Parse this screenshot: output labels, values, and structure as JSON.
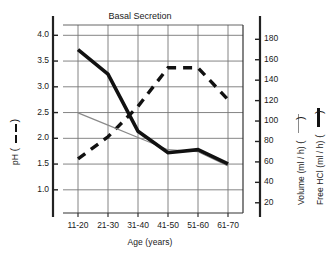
{
  "chart_data": {
    "type": "line",
    "title": "Basal Secretion",
    "xlabel": "Age (years)",
    "categories": [
      "11-20",
      "21-30",
      "31-40",
      "41-50",
      "51-60",
      "61-70"
    ],
    "left_axis": {
      "label": "pH",
      "ticks": [
        "1.0",
        "1.5",
        "2.0",
        "2.5",
        "3.0",
        "3.5",
        "4.0"
      ],
      "tick_values": [
        1.0,
        1.5,
        2.0,
        2.5,
        3.0,
        3.5,
        4.0
      ],
      "ylim": [
        0.55,
        4.2
      ]
    },
    "right_axis": {
      "labels": [
        "Volume (ml / h)",
        "Free HCl (ml / h)"
      ],
      "ticks": [
        "20",
        "40",
        "60",
        "80",
        "100",
        "120",
        "140",
        "160",
        "180"
      ],
      "tick_values": [
        20,
        40,
        60,
        80,
        100,
        120,
        140,
        160,
        180
      ],
      "ylim": [
        10,
        194
      ]
    },
    "grid": true,
    "legend_position": "axis-titles",
    "series": [
      {
        "name": "pH",
        "axis": "left",
        "style": "dashed",
        "color": "#111111",
        "width": 3.4,
        "values": [
          1.6,
          2.03,
          2.62,
          3.37,
          3.37,
          2.75
        ]
      },
      {
        "name": "Volume (ml / h)",
        "axis": "right",
        "style": "thin-solid",
        "color": "#8a8a8a",
        "width": 1.1,
        "values": [
          108,
          96,
          84,
          72,
          70,
          56
        ]
      },
      {
        "name": "Free HCl (ml / h)",
        "axis": "right",
        "style": "thick-solid",
        "color": "#111111",
        "width": 3.6,
        "values": [
          170,
          146,
          90,
          69,
          72,
          58
        ]
      }
    ]
  }
}
